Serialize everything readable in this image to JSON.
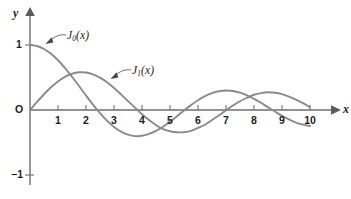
{
  "figure": {
    "background_color": "#ffffff",
    "width": 351,
    "height": 199
  },
  "axes": {
    "x_axis_name": "x",
    "y_axis_name": "y",
    "origin_label": "O",
    "x_ticks": [
      "1",
      "2",
      "3",
      "4",
      "5",
      "6",
      "7",
      "8",
      "9",
      "10"
    ],
    "y_ticks": [
      "1",
      "−1"
    ],
    "y_tick_top": "1",
    "y_tick_bottom": "−1",
    "axis_color": "#6e6e6e",
    "label_color": "#1c1c1c"
  },
  "labels": {
    "j0": {
      "base": "J",
      "sub": "0",
      "arg": "(x)"
    },
    "j1": {
      "base": "J",
      "sub": "1",
      "arg": "(x)"
    }
  },
  "chart_data": {
    "type": "line",
    "title": "",
    "subtitle": "",
    "xlabel": "x",
    "ylabel": "y",
    "xlim": [
      0,
      10.6
    ],
    "ylim": [
      -1.25,
      1.15
    ],
    "grid": false,
    "legend": "inline-annotations",
    "xticks": [
      1,
      2,
      3,
      4,
      5,
      6,
      7,
      8,
      9,
      10
    ],
    "yticks": [
      -1,
      0,
      1
    ],
    "annotations": [
      {
        "text": "J_0(x)",
        "points_to_curve": "J0(x)",
        "label_x": 2.4,
        "label_y": 1.12
      },
      {
        "text": "J_1(x)",
        "points_to_curve": "J1(x)",
        "label_x": 4.8,
        "label_y": 0.6
      }
    ],
    "x": [
      0,
      0.25,
      0.5,
      0.75,
      1,
      1.25,
      1.5,
      1.75,
      2,
      2.25,
      2.5,
      2.75,
      3,
      3.25,
      3.5,
      3.75,
      4,
      4.25,
      4.5,
      4.75,
      5,
      5.25,
      5.5,
      5.75,
      6,
      6.25,
      6.5,
      6.75,
      7,
      7.25,
      7.5,
      7.75,
      8,
      8.25,
      8.5,
      8.75,
      9,
      9.25,
      9.5,
      9.75,
      10
    ],
    "series": [
      {
        "name": "J0(x)",
        "color": "#8a8a8a",
        "values": [
          1.0,
          0.9844,
          0.9385,
          0.8642,
          0.7652,
          0.6459,
          0.5118,
          0.369,
          0.2239,
          0.0827,
          -0.0484,
          -0.1641,
          -0.2601,
          -0.3324,
          -0.3801,
          -0.4026,
          -0.3971,
          -0.3669,
          -0.3205,
          -0.2566,
          -0.1776,
          -0.0968,
          -0.0068,
          0.0749,
          0.1506,
          0.2134,
          0.2601,
          0.2879,
          0.3001,
          0.2921,
          0.2663,
          0.2264,
          0.1717,
          0.1109,
          0.0419,
          -0.0235,
          -0.0903,
          -0.1447,
          -0.1939,
          -0.2243,
          -0.2459
        ],
        "zeros": [
          2.405,
          5.52,
          8.654
        ],
        "extrema": [
          {
            "x": 0,
            "y": 1.0
          },
          {
            "x": 3.83,
            "y": -0.4028
          },
          {
            "x": 7.02,
            "y": 0.3001
          },
          {
            "x": 10.17,
            "y": -0.2497
          }
        ]
      },
      {
        "name": "J1(x)",
        "color": "#8a8a8a",
        "values": [
          0.0,
          0.124,
          0.2423,
          0.3492,
          0.4401,
          0.5106,
          0.5579,
          0.5802,
          0.5767,
          0.5484,
          0.4971,
          0.426,
          0.3391,
          0.2404,
          0.1374,
          0.0366,
          -0.066,
          -0.1538,
          -0.2311,
          -0.2951,
          -0.3276,
          -0.3432,
          -0.3414,
          -0.3221,
          -0.2767,
          -0.2274,
          -0.1538,
          -0.0819,
          -0.0047,
          0.0693,
          0.1352,
          0.1885,
          0.2346,
          0.2604,
          0.2731,
          0.2663,
          0.2453,
          0.2075,
          0.1613,
          0.1052,
          0.0435
        ],
        "zeros": [
          0,
          3.832,
          7.016,
          10.174
        ],
        "extrema": [
          {
            "x": 1.84,
            "y": 0.5819
          },
          {
            "x": 5.33,
            "y": -0.3461
          },
          {
            "x": 8.54,
            "y": 0.2733
          }
        ]
      }
    ]
  }
}
